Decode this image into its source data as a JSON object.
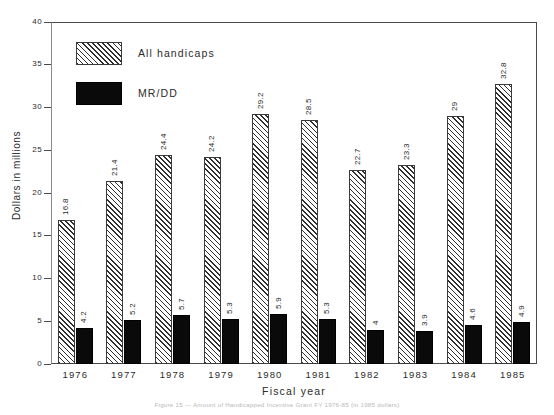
{
  "chart_data": {
    "type": "bar",
    "title": "",
    "xlabel": "Fiscal year",
    "ylabel": "Dollars in millions",
    "ylim": [
      0,
      40
    ],
    "ytick_step": 5,
    "yticks": [
      "0",
      "5",
      "10",
      "15",
      "20",
      "25",
      "30",
      "35",
      "40"
    ],
    "grid": false,
    "legend_position": "upper-left-inside",
    "categories": [
      "1976",
      "1977",
      "1978",
      "1979",
      "1980",
      "1981",
      "1982",
      "1983",
      "1984",
      "1985"
    ],
    "series": [
      {
        "name": "All handicaps",
        "style": "diagonal-hatch",
        "values": [
          16.8,
          21.4,
          24.4,
          24.2,
          29.2,
          28.5,
          22.7,
          23.3,
          29,
          32.8
        ],
        "labels": [
          "16.8",
          "21.4",
          "24.4",
          "24.2",
          "29.2",
          "28.5",
          "22.7",
          "23.3",
          "29",
          "32.8"
        ]
      },
      {
        "name": "MR/DD",
        "style": "solid-black",
        "values": [
          4.2,
          5.2,
          5.7,
          5.3,
          5.9,
          5.3,
          4,
          3.9,
          4.6,
          4.9
        ],
        "labels": [
          "4.2",
          "5.2",
          "5.7",
          "5.3",
          "5.9",
          "5.3",
          "4",
          "3.9",
          "4.6",
          "4.9"
        ]
      }
    ],
    "value_label_rotation": -90,
    "colors": {
      "hatch_line": "#2f2f2f",
      "hatch_fill": "#fdfdfd",
      "solid_fill": "#0a0a0a",
      "axis": "#4a4a4a",
      "text": "#2b2b2b",
      "background": "#ffffff"
    }
  },
  "caption": {
    "text": "Figure 15 — Amount of Handicapped Incentive Grant FY 1976-85 (in 1985 dollars)"
  }
}
